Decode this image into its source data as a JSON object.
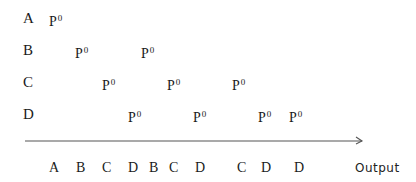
{
  "diagram": {
    "rows": [
      {
        "label": "A",
        "top": 11,
        "pulses": [
          {
            "text": "P",
            "sup": "0",
            "x": 49
          }
        ]
      },
      {
        "label": "B",
        "top": 43,
        "pulses": [
          {
            "text": "P",
            "sup": "0",
            "x": 75
          },
          {
            "text": "P",
            "sup": "0",
            "x": 141
          }
        ]
      },
      {
        "label": "C",
        "top": 75,
        "pulses": [
          {
            "text": "P",
            "sup": "0",
            "x": 102
          },
          {
            "text": "P",
            "sup": "0",
            "x": 167
          },
          {
            "text": "P",
            "sup": "0",
            "x": 232
          }
        ]
      },
      {
        "label": "D",
        "top": 107,
        "pulses": [
          {
            "text": "P",
            "sup": "0",
            "x": 128
          },
          {
            "text": "P",
            "sup": "0",
            "x": 193
          },
          {
            "text": "P",
            "sup": "0",
            "x": 258
          },
          {
            "text": "P",
            "sup": "0",
            "x": 289
          }
        ]
      }
    ],
    "arrow": {
      "x1": 25,
      "x2": 362,
      "y": 141,
      "color": "#555555"
    },
    "output_sequence": [
      {
        "label": "A",
        "x": 49
      },
      {
        "label": "B",
        "x": 76
      },
      {
        "label": "C",
        "x": 102
      },
      {
        "label": "D",
        "x": 128
      },
      {
        "label": "B",
        "x": 149
      },
      {
        "label": "C",
        "x": 169
      },
      {
        "label": "D",
        "x": 195
      },
      {
        "label": "C",
        "x": 237
      },
      {
        "label": "D",
        "x": 261
      },
      {
        "label": "D",
        "x": 294
      }
    ],
    "output_label": "Output"
  }
}
